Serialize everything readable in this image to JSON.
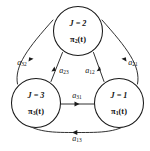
{
  "figure": {
    "type": "state-transition-diagram",
    "background_color": "#ffffff",
    "stroke_color": "#1a1a1a",
    "text_color": "#111111"
  },
  "nodes": [
    {
      "id": "node-2",
      "position": "top",
      "state_label": "J = 2",
      "pi_base": "π",
      "pi_sub": "2",
      "pi_arg": "(t)",
      "cx": 78,
      "cy": 31,
      "r": 24.5
    },
    {
      "id": "node-3",
      "position": "bottom-left",
      "state_label": "J = 3",
      "pi_base": "π",
      "pi_sub": "3",
      "pi_arg": "(t)",
      "cx": 36,
      "cy": 103,
      "r": 24.5
    },
    {
      "id": "node-1",
      "position": "bottom-right",
      "state_label": "J = 1",
      "pi_base": "π",
      "pi_sub": "1",
      "pi_arg": "(t)",
      "cx": 119,
      "cy": 103,
      "r": 24.5
    }
  ],
  "edges": [
    {
      "id": "edge-a32",
      "label_base": "a",
      "label_sub": "32",
      "from": "node-3",
      "to": "node-2",
      "route": "outer-left",
      "label_x": 22,
      "label_y": 63
    },
    {
      "id": "edge-a23",
      "label_base": "a",
      "label_sub": "23",
      "from": "node-2",
      "to": "node-3",
      "route": "inner-left",
      "label_x": 64,
      "label_y": 71
    },
    {
      "id": "edge-a12",
      "label_base": "a",
      "label_sub": "12",
      "from": "node-1",
      "to": "node-2",
      "route": "inner-right",
      "label_x": 90,
      "label_y": 71
    },
    {
      "id": "edge-a21",
      "label_base": "a",
      "label_sub": "21",
      "from": "node-2",
      "to": "node-1",
      "route": "outer-right",
      "label_x": 133,
      "label_y": 63
    },
    {
      "id": "edge-a31",
      "label_base": "a",
      "label_sub": "31",
      "from": "node-3",
      "to": "node-1",
      "route": "middle-horizontal",
      "label_x": 77,
      "label_y": 96
    },
    {
      "id": "edge-a13",
      "label_base": "a",
      "label_sub": "13",
      "from": "node-1",
      "to": "node-3",
      "route": "outer-bottom",
      "label_x": 77,
      "label_y": 139
    }
  ]
}
